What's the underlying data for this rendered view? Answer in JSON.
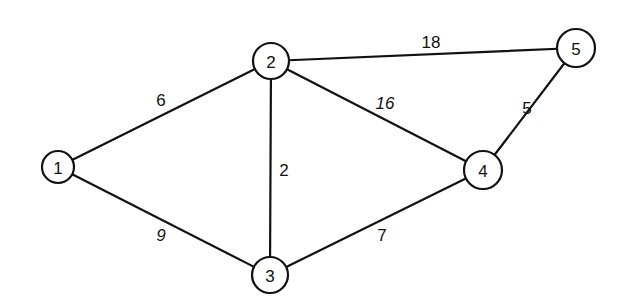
{
  "diagram": {
    "type": "weighted-undirected-graph",
    "stroke_color": "#111111",
    "background": "#ffffff",
    "nodes": [
      {
        "id": "1",
        "label": "1",
        "x": 58,
        "y": 167,
        "r": 16
      },
      {
        "id": "2",
        "label": "2",
        "x": 271,
        "y": 61,
        "r": 18
      },
      {
        "id": "3",
        "label": "3",
        "x": 270,
        "y": 275,
        "r": 18
      },
      {
        "id": "4",
        "label": "4",
        "x": 483,
        "y": 170,
        "r": 19
      },
      {
        "id": "5",
        "label": "5",
        "x": 576,
        "y": 48,
        "r": 19
      }
    ],
    "edges": [
      {
        "from": "1",
        "to": "2",
        "weight": "6",
        "lx": 161,
        "ly": 100,
        "italic": false
      },
      {
        "from": "1",
        "to": "3",
        "weight": "9",
        "lx": 161,
        "ly": 235,
        "italic": true
      },
      {
        "from": "2",
        "to": "3",
        "weight": "2",
        "lx": 284,
        "ly": 170,
        "italic": false
      },
      {
        "from": "2",
        "to": "4",
        "weight": "16",
        "lx": 385,
        "ly": 103,
        "italic": true
      },
      {
        "from": "2",
        "to": "5",
        "weight": "18",
        "lx": 431,
        "ly": 42,
        "italic": false
      },
      {
        "from": "3",
        "to": "4",
        "weight": "7",
        "lx": 382,
        "ly": 235,
        "italic": false
      },
      {
        "from": "4",
        "to": "5",
        "weight": "5",
        "lx": 527,
        "ly": 108,
        "italic": false
      }
    ]
  }
}
